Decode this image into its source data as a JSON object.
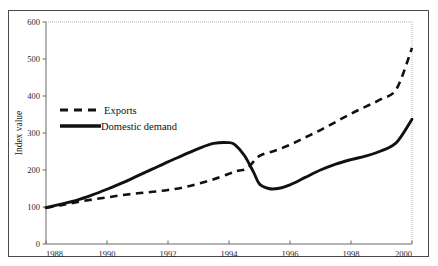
{
  "figure": {
    "background_color": "#ffffff",
    "border_color": "#4a4a4a",
    "axis_color": "#555555",
    "series_color": "#111111"
  },
  "chart_data": {
    "type": "line",
    "title": "",
    "subtitle": "",
    "xlabel": "",
    "ylabel": "Index value",
    "xlim": [
      1988,
      2000
    ],
    "ylim": [
      0,
      600
    ],
    "ytick_labels": [
      "0",
      "100",
      "200",
      "300",
      "400",
      "500",
      "600"
    ],
    "yticks": [
      0,
      100,
      200,
      300,
      400,
      500,
      600
    ],
    "xtick_labels": [
      "1988",
      "1990",
      "1992",
      "1994",
      "1996",
      "1998",
      "2000"
    ],
    "xticks": [
      1988,
      1990,
      1992,
      1994,
      1996,
      1998,
      2000
    ],
    "grid": false,
    "legend_position": "upper-left-inside",
    "annotations": [],
    "series": [
      {
        "name": "Exports",
        "style": "dashed",
        "color": "#111111",
        "x": [
          1988,
          1988.5,
          1989,
          1989.5,
          1990,
          1990.5,
          1991,
          1991.5,
          1992,
          1992.5,
          1993,
          1993.5,
          1994,
          1994.3,
          1994.6,
          1995,
          1995.5,
          1996,
          1996.5,
          1997,
          1997.5,
          1998,
          1998.5,
          1999,
          1999.5,
          2000
        ],
        "values": [
          98,
          105,
          113,
          120,
          126,
          132,
          137,
          141,
          146,
          153,
          163,
          175,
          190,
          198,
          205,
          238,
          252,
          268,
          288,
          308,
          330,
          352,
          372,
          392,
          420,
          530
        ]
      },
      {
        "name": "Domestic demand",
        "style": "solid",
        "color": "#111111",
        "x": [
          1988,
          1988.5,
          1989,
          1989.5,
          1990,
          1990.5,
          1991,
          1991.5,
          1992,
          1992.5,
          1993,
          1993.5,
          1994,
          1994.2,
          1994.5,
          1994.8,
          1995,
          1995.3,
          1995.6,
          1996,
          1996.5,
          1997,
          1997.5,
          1998,
          1998.5,
          1999,
          1999.5,
          2000
        ],
        "values": [
          98,
          108,
          118,
          132,
          148,
          165,
          184,
          203,
          222,
          240,
          258,
          272,
          274,
          268,
          240,
          195,
          162,
          150,
          150,
          160,
          180,
          200,
          216,
          228,
          238,
          252,
          275,
          337
        ]
      }
    ]
  },
  "legend": {
    "items": [
      {
        "label": "Exports",
        "style": "dashed"
      },
      {
        "label": "Domestic demand",
        "style": "solid"
      }
    ]
  }
}
